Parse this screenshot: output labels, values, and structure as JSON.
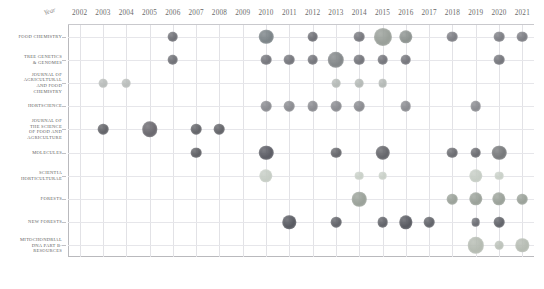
{
  "chart_data": {
    "type": "scatter",
    "title": "",
    "xlabel": "Year",
    "ylabel": "",
    "x": [
      2002,
      2003,
      2004,
      2005,
      2006,
      2007,
      2008,
      2009,
      2010,
      2011,
      2012,
      2013,
      2014,
      2015,
      2016,
      2017,
      2018,
      2019,
      2020,
      2021
    ],
    "categories": [
      "FOOD CHEMISTRY",
      "TREE GENETICS & GENOMES",
      "JOURNAL OF AGRICULTURAL AND FOOD CHEMISTRY",
      "HORTSCIENCE",
      "JOURNAL OF THE SCIENCE OF FOOD AND AGRICULTURE",
      "MOLECULES",
      "SCIENTIA HORTICULTURAE",
      "FORESTS",
      "NEW FORESTS",
      "MITOCHONDRIAL DNA PART B-RESOURCES"
    ],
    "xlim": [
      2002,
      2021
    ],
    "grid": true,
    "legend": "none",
    "points": [
      {
        "journal": "FOOD CHEMISTRY",
        "year": 2006,
        "value": 2,
        "color": "#6f7076"
      },
      {
        "journal": "FOOD CHEMISTRY",
        "year": 2010,
        "value": 5,
        "color": "#7c8488"
      },
      {
        "journal": "FOOD CHEMISTRY",
        "year": 2012,
        "value": 2,
        "color": "#6f7076"
      },
      {
        "journal": "FOOD CHEMISTRY",
        "year": 2014,
        "value": 2,
        "color": "#77787e"
      },
      {
        "journal": "FOOD CHEMISTRY",
        "year": 2015,
        "value": 9,
        "color": "#9aa09a"
      },
      {
        "journal": "FOOD CHEMISTRY",
        "year": 2016,
        "value": 4,
        "color": "#8d9390"
      },
      {
        "journal": "FOOD CHEMISTRY",
        "year": 2018,
        "value": 2,
        "color": "#7d7e84"
      },
      {
        "journal": "FOOD CHEMISTRY",
        "year": 2020,
        "value": 2,
        "color": "#7d7e84"
      },
      {
        "journal": "FOOD CHEMISTRY",
        "year": 2021,
        "value": 2,
        "color": "#7d7e84"
      },
      {
        "journal": "TREE GENETICS & GENOMES",
        "year": 2006,
        "value": 2,
        "color": "#6f7076"
      },
      {
        "journal": "TREE GENETICS & GENOMES",
        "year": 2010,
        "value": 2,
        "color": "#75767c"
      },
      {
        "journal": "TREE GENETICS & GENOMES",
        "year": 2011,
        "value": 2,
        "color": "#75767c"
      },
      {
        "journal": "TREE GENETICS & GENOMES",
        "year": 2012,
        "value": 2,
        "color": "#75767c"
      },
      {
        "journal": "TREE GENETICS & GENOMES",
        "year": 2013,
        "value": 7,
        "color": "#84888a"
      },
      {
        "journal": "TREE GENETICS & GENOMES",
        "year": 2014,
        "value": 2,
        "color": "#75767c"
      },
      {
        "journal": "TREE GENETICS & GENOMES",
        "year": 2015,
        "value": 2,
        "color": "#75767c"
      },
      {
        "journal": "TREE GENETICS & GENOMES",
        "year": 2016,
        "value": 2,
        "color": "#75767c"
      },
      {
        "journal": "TREE GENETICS & GENOMES",
        "year": 2020,
        "value": 2,
        "color": "#75767c"
      },
      {
        "journal": "JOURNAL OF AGRICULTURAL AND FOOD CHEMISTRY",
        "year": 2003,
        "value": 1,
        "color": "#b9bdbb"
      },
      {
        "journal": "JOURNAL OF AGRICULTURAL AND FOOD CHEMISTRY",
        "year": 2004,
        "value": 1,
        "color": "#b9bdbb"
      },
      {
        "journal": "JOURNAL OF AGRICULTURAL AND FOOD CHEMISTRY",
        "year": 2013,
        "value": 1,
        "color": "#b4b9b6"
      },
      {
        "journal": "JOURNAL OF AGRICULTURAL AND FOOD CHEMISTRY",
        "year": 2014,
        "value": 1,
        "color": "#b4b9b6"
      },
      {
        "journal": "JOURNAL OF AGRICULTURAL AND FOOD CHEMISTRY",
        "year": 2015,
        "value": 1,
        "color": "#b4b9b6"
      },
      {
        "journal": "HORTSCIENCE",
        "year": 2010,
        "value": 2,
        "color": "#8a8b90"
      },
      {
        "journal": "HORTSCIENCE",
        "year": 2011,
        "value": 2,
        "color": "#8a8b90"
      },
      {
        "journal": "HORTSCIENCE",
        "year": 2012,
        "value": 2,
        "color": "#8a8b90"
      },
      {
        "journal": "HORTSCIENCE",
        "year": 2013,
        "value": 2,
        "color": "#8a8b90"
      },
      {
        "journal": "HORTSCIENCE",
        "year": 2014,
        "value": 2,
        "color": "#8a8b90"
      },
      {
        "journal": "HORTSCIENCE",
        "year": 2016,
        "value": 2,
        "color": "#8a8b90"
      },
      {
        "journal": "HORTSCIENCE",
        "year": 2019,
        "value": 2,
        "color": "#8a8b90"
      },
      {
        "journal": "JOURNAL OF THE SCIENCE OF FOOD AND AGRICULTURE",
        "year": 2003,
        "value": 2,
        "color": "#636469"
      },
      {
        "journal": "JOURNAL OF THE SCIENCE OF FOOD AND AGRICULTURE",
        "year": 2005,
        "value": 6,
        "color": "#6c6a70"
      },
      {
        "journal": "JOURNAL OF THE SCIENCE OF FOOD AND AGRICULTURE",
        "year": 2007,
        "value": 2,
        "color": "#636469"
      },
      {
        "journal": "JOURNAL OF THE SCIENCE OF FOOD AND AGRICULTURE",
        "year": 2008,
        "value": 2,
        "color": "#636469"
      },
      {
        "journal": "MOLECULES",
        "year": 2007,
        "value": 2,
        "color": "#5f6065"
      },
      {
        "journal": "MOLECULES",
        "year": 2010,
        "value": 5,
        "color": "#5d5e66"
      },
      {
        "journal": "MOLECULES",
        "year": 2013,
        "value": 2,
        "color": "#66676c"
      },
      {
        "journal": "MOLECULES",
        "year": 2015,
        "value": 5,
        "color": "#66676c"
      },
      {
        "journal": "MOLECULES",
        "year": 2018,
        "value": 2,
        "color": "#6c6d72"
      },
      {
        "journal": "MOLECULES",
        "year": 2019,
        "value": 2,
        "color": "#6c6d72"
      },
      {
        "journal": "MOLECULES",
        "year": 2020,
        "value": 5,
        "color": "#787a7c"
      },
      {
        "journal": "SCIENTIA HORTICULTURAE",
        "year": 2010,
        "value": 4,
        "color": "#c6cdc5"
      },
      {
        "journal": "SCIENTIA HORTICULTURAE",
        "year": 2014,
        "value": 1,
        "color": "#c9d0c8"
      },
      {
        "journal": "SCIENTIA HORTICULTURAE",
        "year": 2015,
        "value": 1,
        "color": "#c9d0c8"
      },
      {
        "journal": "SCIENTIA HORTICULTURAE",
        "year": 2019,
        "value": 4,
        "color": "#c6cdc5"
      },
      {
        "journal": "SCIENTIA HORTICULTURAE",
        "year": 2020,
        "value": 1,
        "color": "#c9d0c8"
      },
      {
        "journal": "FORESTS",
        "year": 2014,
        "value": 5,
        "color": "#9ba29a"
      },
      {
        "journal": "FORESTS",
        "year": 2018,
        "value": 2,
        "color": "#9ba29a"
      },
      {
        "journal": "FORESTS",
        "year": 2019,
        "value": 4,
        "color": "#9ba29a"
      },
      {
        "journal": "FORESTS",
        "year": 2020,
        "value": 4,
        "color": "#9ba29a"
      },
      {
        "journal": "FORESTS",
        "year": 2021,
        "value": 2,
        "color": "#9ba29a"
      },
      {
        "journal": "NEW FORESTS",
        "year": 2011,
        "value": 4,
        "color": "#595b62"
      },
      {
        "journal": "NEW FORESTS",
        "year": 2013,
        "value": 2,
        "color": "#62646a"
      },
      {
        "journal": "NEW FORESTS",
        "year": 2015,
        "value": 2,
        "color": "#62646a"
      },
      {
        "journal": "NEW FORESTS",
        "year": 2016,
        "value": 4,
        "color": "#595b62"
      },
      {
        "journal": "NEW FORESTS",
        "year": 2017,
        "value": 2,
        "color": "#62646a"
      },
      {
        "journal": "NEW FORESTS",
        "year": 2019,
        "value": 1,
        "color": "#6d6f75"
      },
      {
        "journal": "NEW FORESTS",
        "year": 2020,
        "value": 2,
        "color": "#62646a"
      },
      {
        "journal": "MITOCHONDRIAL DNA PART B-RESOURCES",
        "year": 2019,
        "value": 7,
        "color": "#b6bcb3"
      },
      {
        "journal": "MITOCHONDRIAL DNA PART B-RESOURCES",
        "year": 2020,
        "value": 1,
        "color": "#bcc2ba"
      },
      {
        "journal": "MITOCHONDRIAL DNA PART B-RESOURCES",
        "year": 2021,
        "value": 4,
        "color": "#b6bcb3"
      }
    ]
  },
  "axis": {
    "x_title": "Year",
    "x_ticks": [
      "2002",
      "2003",
      "2004",
      "2005",
      "2006",
      "2007",
      "2008",
      "2009",
      "2010",
      "2011",
      "2012",
      "2013",
      "2014",
      "2015",
      "2016",
      "2017",
      "2018",
      "2019",
      "2020",
      "2021"
    ],
    "y_ticks": [
      {
        "id": "food-chemistry",
        "lines": [
          "FOOD CHEMISTRY"
        ]
      },
      {
        "id": "tree-genetics-genomes",
        "lines": [
          "TREE GENETICS",
          "& GENOMES"
        ]
      },
      {
        "id": "journal-agricultural-food-chemistry",
        "lines": [
          "JOURNAL OF",
          "AGRICULTURAL",
          "AND FOOD",
          "CHEMISTRY"
        ]
      },
      {
        "id": "hortscience",
        "lines": [
          "HORTSCIENCE"
        ]
      },
      {
        "id": "journal-science-food-agriculture",
        "lines": [
          "JOURNAL OF",
          "THE SCIENCE",
          "OF FOOD AND",
          "AGRICULTURE"
        ]
      },
      {
        "id": "molecules",
        "lines": [
          "MOLECULES"
        ]
      },
      {
        "id": "scientia-horticulturae",
        "lines": [
          "SCIENTIA",
          "HORTICULTURAE"
        ]
      },
      {
        "id": "forests",
        "lines": [
          "FORESTS"
        ]
      },
      {
        "id": "new-forests",
        "lines": [
          "NEW FORESTS"
        ]
      },
      {
        "id": "mitochondrial-dna-part-b-resources",
        "lines": [
          "MITOCHONDRIAL",
          "DNA PART B-",
          "RESOURCES"
        ]
      }
    ]
  }
}
